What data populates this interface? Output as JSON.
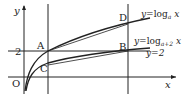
{
  "diagram": {
    "axes": {
      "x_label": "x",
      "y_label": "y",
      "origin_label": "O"
    },
    "y_tick": "2",
    "points": {
      "A": "A",
      "B": "B",
      "C": "C",
      "D": "D"
    },
    "curves": [
      {
        "name": "log_a",
        "label_prefix": "y=log",
        "label_sub": "a",
        "label_suffix": "x"
      },
      {
        "name": "log_a_plus_2",
        "label_prefix": "y=log",
        "label_sub": "a+2",
        "label_suffix": "x"
      }
    ],
    "line_label": "y=2",
    "colors": {
      "stroke": "#222222",
      "background": "#ffffff"
    }
  }
}
